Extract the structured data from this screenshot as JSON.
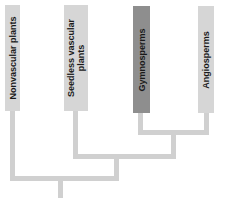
{
  "colors": {
    "box_light": "#d6d6d6",
    "box_dark": "#8e8e8e",
    "line": "#d0d0d0",
    "text": "#1a1a1a"
  },
  "taxa": [
    {
      "id": "nonvascular",
      "label": "Nonvascular plants",
      "highlighted": false
    },
    {
      "id": "seedless",
      "label": "Seedless vascular plants",
      "line1": "Seedless vascular",
      "line2": "plants",
      "highlighted": false
    },
    {
      "id": "gymnosperms",
      "label": "Gymnosperms",
      "highlighted": true
    },
    {
      "id": "angiosperms",
      "label": "Angiosperms",
      "highlighted": false
    }
  ],
  "tree": {
    "root": {
      "children": [
        "nonvascular",
        "node_vascular"
      ]
    },
    "node_vascular": {
      "children": [
        "seedless",
        "node_seed"
      ]
    },
    "node_seed": {
      "children": [
        "gymnosperms",
        "angiosperms"
      ]
    }
  }
}
